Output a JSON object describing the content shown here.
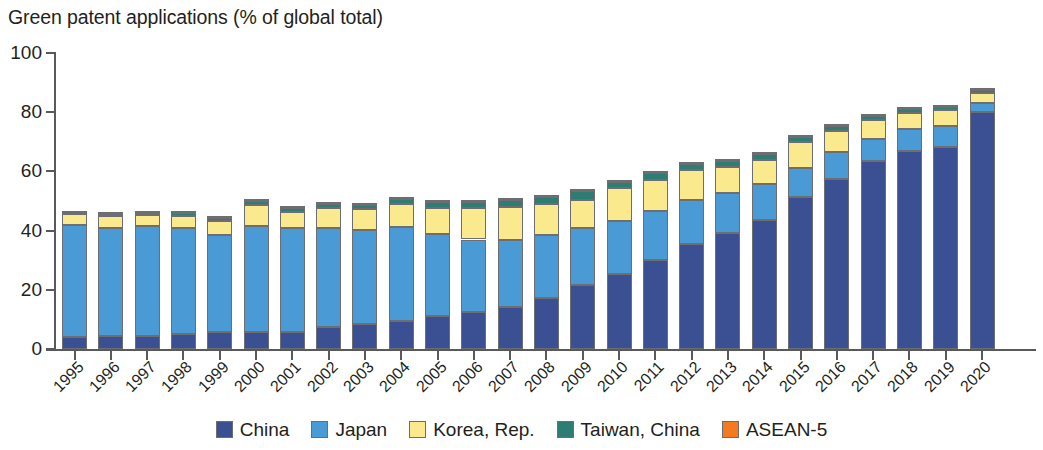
{
  "chart_data": {
    "type": "bar",
    "stacked": true,
    "title": "Green patent applications (% of global total)",
    "xlabel": "",
    "ylabel": "",
    "ylim": [
      0,
      100
    ],
    "yticks": [
      0,
      20,
      40,
      60,
      80,
      100
    ],
    "grid": false,
    "legend_position": "bottom",
    "categories": [
      "1995",
      "1996",
      "1997",
      "1998",
      "1999",
      "2000",
      "2001",
      "2002",
      "2003",
      "2004",
      "2005",
      "2006",
      "2007",
      "2008",
      "2009",
      "2010",
      "2011",
      "2012",
      "2013",
      "2014",
      "2015",
      "2016",
      "2017",
      "2018",
      "2019",
      "2020"
    ],
    "series": [
      {
        "name": "China",
        "color": "#3b4f93",
        "values": [
          4.2,
          4.5,
          4.5,
          5.0,
          5.8,
          5.8,
          5.8,
          7.5,
          8.4,
          9.4,
          11.2,
          12.6,
          14.3,
          17.3,
          21.7,
          25.4,
          30.0,
          35.4,
          39.2,
          43.6,
          51.5,
          57.6,
          63.6,
          66.8,
          68.4,
          80.0
        ]
      },
      {
        "name": "Japan",
        "color": "#4a9bd5",
        "values": [
          37.8,
          36.5,
          37.0,
          36.0,
          32.7,
          35.9,
          35.0,
          33.5,
          31.9,
          31.7,
          27.5,
          24.4,
          22.6,
          21.1,
          19.2,
          17.9,
          16.5,
          15.1,
          13.4,
          12.3,
          9.5,
          8.8,
          7.4,
          7.5,
          6.8,
          3.0
        ]
      },
      {
        "name": "Korea, Rep.",
        "color": "#fbe98e",
        "values": [
          3.5,
          3.8,
          3.8,
          4.0,
          4.8,
          7.0,
          5.6,
          6.5,
          7.0,
          8.0,
          9.0,
          10.5,
          11.0,
          10.5,
          9.6,
          11.0,
          10.5,
          9.9,
          9.0,
          8.0,
          8.8,
          7.4,
          6.5,
          5.6,
          5.5,
          3.4
        ]
      },
      {
        "name": "Taiwan, China",
        "color": "#2e7d74",
        "values": [
          0.5,
          0.7,
          0.7,
          0.8,
          1.0,
          1.3,
          1.2,
          1.4,
          1.5,
          1.7,
          2.0,
          2.3,
          2.4,
          2.6,
          3.0,
          2.2,
          2.6,
          2.2,
          2.0,
          2.0,
          1.8,
          1.5,
          1.3,
          1.2,
          1.2,
          1.0
        ]
      },
      {
        "name": "ASEAN-5",
        "color": "#f47a20",
        "values": [
          0.1,
          0.1,
          0.1,
          0.1,
          0.1,
          0.1,
          0.1,
          0.1,
          0.1,
          0.1,
          0.1,
          0.1,
          0.1,
          0.1,
          0.1,
          0.1,
          0.1,
          0.1,
          0.1,
          0.1,
          0.1,
          0.1,
          0.1,
          0.1,
          0.1,
          0.1
        ]
      }
    ],
    "totals": [
      46.1,
      45.6,
      46.1,
      45.9,
      44.4,
      50.1,
      47.7,
      49.0,
      48.9,
      50.9,
      49.8,
      49.9,
      50.4,
      51.6,
      53.6,
      56.6,
      59.7,
      62.7,
      63.7,
      66.0,
      71.7,
      75.4,
      78.9,
      81.2,
      81.9,
      87.5
    ]
  },
  "legend": {
    "items": [
      {
        "label": "China",
        "color": "#3b4f93"
      },
      {
        "label": "Japan",
        "color": "#4a9bd5"
      },
      {
        "label": "Korea, Rep.",
        "color": "#fbe98e"
      },
      {
        "label": "Taiwan, China",
        "color": "#2e7d74"
      },
      {
        "label": "ASEAN-5",
        "color": "#f47a20"
      }
    ]
  },
  "axis": {
    "stroke": "#58595b",
    "segment_stroke": "#6d6e71"
  }
}
